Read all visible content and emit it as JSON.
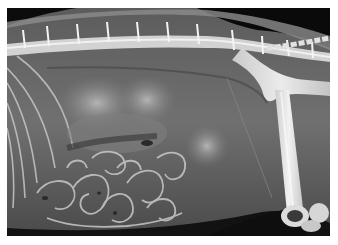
{
  "image": {
    "subject": "lateral abdominal radiograph of a dog",
    "description": "X-ray showing spine along top, ribs at left, intestinal loops in lower-left, pelvis and femur at right",
    "colors": {
      "background_frame": "#ffffff",
      "soft_tissue": "#6a6a6a",
      "air_dark": "#0a0a0a",
      "bone": "#e6e6e6"
    }
  }
}
